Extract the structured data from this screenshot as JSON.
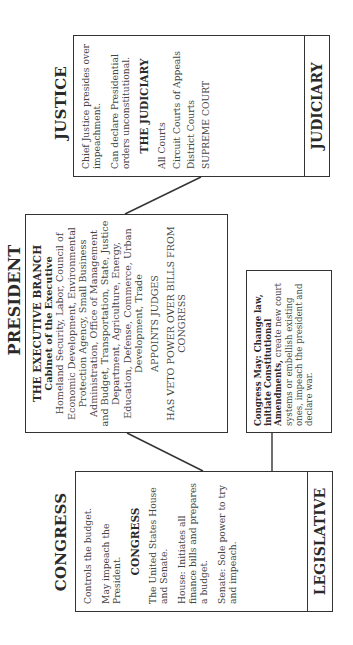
{
  "diagram": {
    "orientation": "rotated 90 degrees counter-clockwise",
    "justice": {
      "title": "JUSTICE",
      "branch_label": "JUDICIARY",
      "statements": [
        "Chief Justice presides over impeachment.",
        "Can declare Presidential orders unconstitutional."
      ],
      "sub_heading": "THE JUDICIARY",
      "courts": [
        "All Courts",
        "Circuit Courts of Appeals",
        "District Courts",
        "SUPREME COURT"
      ]
    },
    "president": {
      "title": "PRESIDENT",
      "heading": "THE EXECUTIVE BRANCH",
      "sub_heading": "Cabinet of the Executive",
      "cabinet": "Homeland Security, Labor, Council of Economic Development, Environmental Protection Agency, Small Business Administration, Office of Management and Budget, Transportation, State, Justice Department, Agriculture, Energy, Education, Defense, Commerce, Urban Development, Trade",
      "power_1": "APPOINTS JUDGES",
      "power_2": "HAS VETO POWER OVER BILLS FROM CONGRESS"
    },
    "congress_may": {
      "bold_text": "Congress May: Change law, initiate Constitutional Amendments,",
      "text": " create new court systems or embellish existing ones, impeach the president and declare war."
    },
    "congress": {
      "title": "CONGRESS",
      "branch_label": "LEGISLATIVE",
      "statements": [
        "Controls the budget.",
        "May impeach the President."
      ],
      "sub_heading": "CONGRESS",
      "details": [
        "The United States House and Senate.",
        "House: Initiates all finance bills and prepares a budget.",
        "Senate: Sole power to try and impeach."
      ]
    },
    "colors": {
      "border": "#333333",
      "text": "#444444",
      "background": "#ffffff"
    }
  }
}
